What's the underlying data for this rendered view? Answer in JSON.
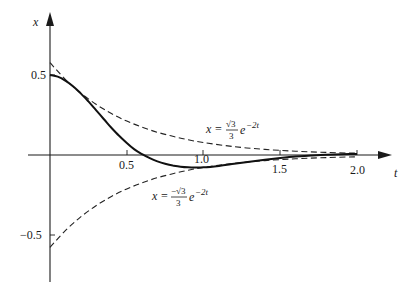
{
  "chart_data": {
    "type": "line",
    "title": "",
    "xlabel": "t",
    "ylabel": "x",
    "xlim": [
      0,
      2.2
    ],
    "ylim": [
      -0.75,
      0.85
    ],
    "grid": false,
    "x_ticks": [
      {
        "value": 0.5,
        "label": "0.5"
      },
      {
        "value": 1.0,
        "label": "1.0"
      },
      {
        "value": 1.5,
        "label": "1.5"
      },
      {
        "value": 2.0,
        "label": "2.0"
      }
    ],
    "y_ticks": [
      {
        "value": 0.5,
        "label": "0.5"
      },
      {
        "value": -0.5,
        "label": "−0.5"
      }
    ],
    "series": [
      {
        "name": "x(t) solution",
        "style": "solid",
        "x": [
          0.0,
          0.05,
          0.1,
          0.15,
          0.2,
          0.25,
          0.3,
          0.35,
          0.4,
          0.45,
          0.5,
          0.55,
          0.6,
          0.65,
          0.7,
          0.75,
          0.8,
          0.85,
          0.9,
          0.95,
          1.0,
          1.1,
          1.2,
          1.3,
          1.4,
          1.5,
          1.6,
          1.7,
          1.8,
          1.9,
          2.0
        ],
        "values": [
          0.5,
          0.49,
          0.465,
          0.43,
          0.385,
          0.335,
          0.28,
          0.225,
          0.17,
          0.12,
          0.075,
          0.035,
          0.005,
          -0.02,
          -0.04,
          -0.055,
          -0.066,
          -0.073,
          -0.077,
          -0.078,
          -0.077,
          -0.068,
          -0.055,
          -0.042,
          -0.03,
          -0.019,
          -0.01,
          -0.003,
          0.002,
          0.005,
          0.006
        ]
      },
      {
        "name": "upper envelope",
        "style": "dashed",
        "formula": "x = (√3/3) e^(−2t)",
        "x": [
          0.0,
          0.1,
          0.2,
          0.3,
          0.4,
          0.5,
          0.6,
          0.7,
          0.8,
          0.9,
          1.0,
          1.2,
          1.4,
          1.6,
          1.8,
          2.0
        ],
        "values": [
          0.577,
          0.473,
          0.387,
          0.317,
          0.259,
          0.212,
          0.174,
          0.142,
          0.117,
          0.095,
          0.078,
          0.052,
          0.035,
          0.024,
          0.016,
          0.011
        ]
      },
      {
        "name": "lower envelope",
        "style": "dashed",
        "formula": "x = (−√3/3) e^(−2t)",
        "x": [
          0.0,
          0.1,
          0.2,
          0.3,
          0.4,
          0.5,
          0.6,
          0.7,
          0.8,
          0.9,
          1.0,
          1.2,
          1.4,
          1.6,
          1.8,
          2.0
        ],
        "values": [
          -0.577,
          -0.473,
          -0.387,
          -0.317,
          -0.259,
          -0.212,
          -0.174,
          -0.142,
          -0.117,
          -0.095,
          -0.078,
          -0.052,
          -0.035,
          -0.024,
          -0.016,
          -0.011
        ]
      }
    ],
    "annotations": [
      {
        "text": "x = (√3/3) e^(−2t)",
        "near": {
          "t": 1.4,
          "x": 0.3
        }
      },
      {
        "text": "x = (−√3/3) e^(−2t)",
        "near": {
          "t": 1.0,
          "x": -0.2
        }
      }
    ]
  },
  "labels": {
    "x_axis": "t",
    "y_axis": "x",
    "tick_05": "0.5",
    "tick_10": "1.0",
    "tick_15": "1.5",
    "tick_20": "2.0",
    "ytick_pos": "0.5",
    "ytick_neg": "−0.5",
    "upper_eq_lhs": "x =",
    "upper_eq_num": "√3",
    "upper_eq_den": "3",
    "upper_eq_exp_base": "e",
    "upper_eq_exp": "−2t",
    "lower_eq_lhs": "x =",
    "lower_eq_num": "−√3",
    "lower_eq_den": "3",
    "lower_eq_exp_base": "e",
    "lower_eq_exp": "−2t"
  }
}
